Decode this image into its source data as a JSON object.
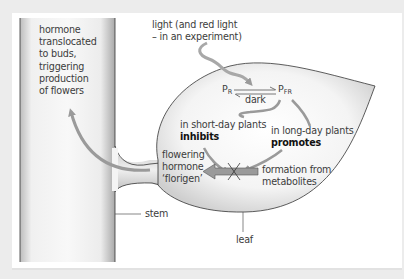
{
  "diagram": {
    "colors": {
      "background": "#ececec",
      "panel": "#ffffff",
      "arrow": "#9a9a9a",
      "outline": "#333333",
      "text": "#3c3c3c"
    },
    "labels": {
      "hormone_translocated": "hormone\ntranslocated\nto buds,\ntriggering\nproduction\nof flowers",
      "light": "light (and red light\n– in an experiment)",
      "short_day": "in short-day plants",
      "inhibits": "inhibits",
      "long_day": "in long-day plants",
      "promotes": "promotes",
      "florigen": "flowering\nhormone\n‘florigen’",
      "formation": "formation from\nmetabolites",
      "stem": "stem",
      "leaf": "leaf"
    },
    "phytochrome": {
      "pr_main": "P",
      "pr_sub": "R",
      "pfr_main": "P",
      "pfr_sub": "FR",
      "reverse_label": "dark"
    },
    "parts": [
      "stem",
      "leaf"
    ]
  }
}
